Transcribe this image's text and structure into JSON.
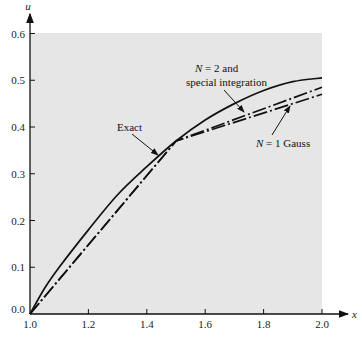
{
  "chart_data": {
    "type": "line",
    "title": "",
    "xlabel": "x",
    "ylabel": "u",
    "xlim": [
      1.0,
      2.0
    ],
    "ylim": [
      0.0,
      0.6
    ],
    "grid": false,
    "background": "#e6e6e6",
    "x_ticks": [
      "1.0",
      "1.2",
      "1.4",
      "1.6",
      "1.8",
      "2.0"
    ],
    "y_ticks": [
      "0.0",
      "0.1",
      "0.2",
      "0.3",
      "0.4",
      "0.5",
      "0.6"
    ],
    "series": [
      {
        "name": "Exact",
        "style": "solid",
        "x": [
          1.0,
          1.05,
          1.1,
          1.2,
          1.3,
          1.4,
          1.5,
          1.6,
          1.7,
          1.8,
          1.9,
          2.0
        ],
        "y": [
          0.0,
          0.055,
          0.1,
          0.18,
          0.255,
          0.315,
          0.37,
          0.415,
          0.45,
          0.478,
          0.497,
          0.505
        ]
      },
      {
        "name": "N = 2 and special integration",
        "style": "dash-dot",
        "x": [
          1.0,
          1.5,
          2.0
        ],
        "y": [
          0.0,
          0.37,
          0.485
        ]
      },
      {
        "name": "N = 1 Gauss",
        "style": "dash-dot",
        "x": [
          1.0,
          1.5,
          2.0
        ],
        "y": [
          0.0,
          0.37,
          0.47
        ]
      }
    ],
    "annotations": [
      {
        "text": "Exact",
        "points_to": [
          1.4,
          0.315
        ]
      },
      {
        "text_line1": "N = 2  and",
        "text_line2": "special integration",
        "points_to": [
          1.7,
          0.43
        ]
      },
      {
        "text": "N = 1  Gauss",
        "points_to": [
          1.82,
          0.455
        ]
      }
    ]
  },
  "labels": {
    "x_axis": "x",
    "y_axis": "u",
    "exact": "Exact",
    "n2_line1_pre": "N",
    "n2_line1_post": " = 2  and",
    "n2_line2": "special integration",
    "n1_pre": "N",
    "n1_post": " = 1  Gauss"
  }
}
